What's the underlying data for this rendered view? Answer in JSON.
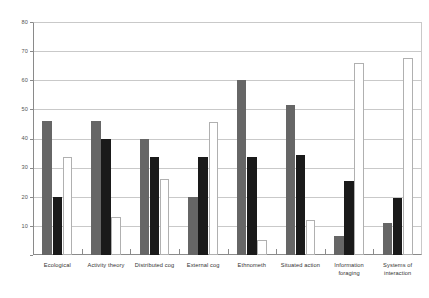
{
  "chart_data": {
    "type": "bar",
    "title": "",
    "xlabel": "",
    "ylabel": "",
    "ylim": [
      0,
      80
    ],
    "ytick_step": 10,
    "yticks": [
      0,
      10,
      20,
      30,
      40,
      50,
      60,
      70,
      80
    ],
    "ytick_labels": [
      "0",
      "10",
      "20",
      "30",
      "40",
      "50",
      "60",
      "70",
      "80"
    ],
    "grid": true,
    "legend": "none",
    "categories": [
      "Ecological",
      "Activity theory",
      "Distributed cog",
      "External cog",
      "Ethnometh",
      "Situated action",
      "Information foraging",
      "Systems of interaction"
    ],
    "category_lines": [
      [
        "Ecological"
      ],
      [
        "Activity theory"
      ],
      [
        "Distributed cog"
      ],
      [
        "External cog"
      ],
      [
        "Ethnometh"
      ],
      [
        "Situated action"
      ],
      [
        "Information",
        "foraging"
      ],
      [
        "Systems of",
        "interaction"
      ]
    ],
    "series": [
      {
        "name": "series-1",
        "color": "#666666",
        "values": [
          46,
          46,
          40,
          20,
          60,
          51.5,
          6.5,
          11
        ]
      },
      {
        "name": "series-2",
        "color": "#1a1a1a",
        "values": [
          20,
          40,
          33.5,
          33.5,
          33.5,
          34.5,
          25.5,
          19.5
        ]
      },
      {
        "name": "series-3",
        "color": "#ffffff",
        "values": [
          33.5,
          13,
          26,
          45.5,
          5,
          12,
          66,
          67.5
        ]
      }
    ]
  },
  "colors": {
    "background": "#ffffff",
    "axis": "#8a8a8a",
    "grid": "#c9c9c9",
    "text": "#333333",
    "series1": "#666666",
    "series2": "#1a1a1a",
    "series3_fill": "#ffffff",
    "series3_stroke": "#b0b0b0"
  }
}
